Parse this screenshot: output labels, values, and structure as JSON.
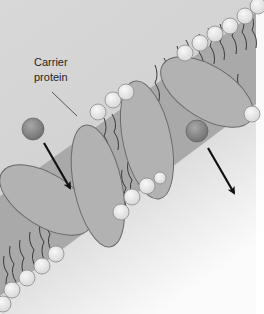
{
  "figure": {
    "label": {
      "line1": "Carrier",
      "line2": "protein"
    },
    "elements": {
      "carrier_proteins": 2,
      "solute_molecules": 2,
      "arrows": 2,
      "arrow_direction": "down-right"
    },
    "colors": {
      "background": "#dcdcdc",
      "background_light": "#f7f7f7",
      "protein_fill": "#b3b3b3",
      "protein_stroke": "#6d6d6d",
      "lipid_head": "#ececec",
      "lipid_tail": "#3a3a3a",
      "membrane_core": "#a8a8a8",
      "solute": "#8a8a8a",
      "arrow": "#111111"
    }
  }
}
